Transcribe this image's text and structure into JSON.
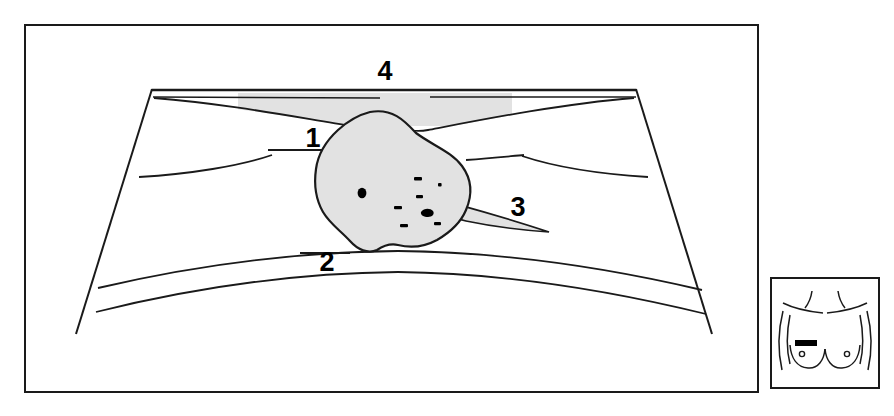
{
  "figure": {
    "kind": "anatomical-line-diagram",
    "title_visible": false,
    "background_color": "#ffffff",
    "line_color": "#1a1a1a",
    "mass_fill_color": "#e2e2e2",
    "band_fill_color": "#e2e2e2",
    "marks_color": "#000000"
  },
  "main_panel": {
    "name": "mammogram-cross-section-panel",
    "frame": {
      "x": 25,
      "y": 25,
      "width": 733,
      "height": 367,
      "stroke_width": 2
    }
  },
  "labels": [
    {
      "id": "1",
      "text": "1",
      "x": 322,
      "y": 137,
      "points_to": "skin-retraction-line"
    },
    {
      "id": "2",
      "text": "2",
      "x": 333,
      "y": 261,
      "points_to": "lower-parenchymal-border"
    },
    {
      "id": "3",
      "text": "3",
      "x": 521,
      "y": 214,
      "points_to": "spiculated-extension"
    },
    {
      "id": "4",
      "text": "4",
      "x": 387,
      "y": 80,
      "points_to": "shaded-skin-band"
    }
  ],
  "structures": {
    "shaded_band": {
      "name": "shaded-skin-band",
      "description": "horizontal shaded band along the top edge",
      "x_start": 238,
      "x_end": 512,
      "fill": "#e2e2e2"
    },
    "mass": {
      "name": "irregular-mass",
      "description": "central irregular shaded mass lesion",
      "fill": "#e2e2e2",
      "stroke": "#1a1a1a",
      "center_x": 398,
      "center_y": 186
    },
    "spiculation": {
      "name": "spiculated-extension",
      "description": "thin tapered wedge extending right from the mass toward label 3",
      "tip_x": 549,
      "tip_y": 232
    },
    "calcifications": {
      "name": "microcalcification-cluster",
      "count": 9,
      "marks": [
        {
          "type": "dot",
          "x": 362,
          "y": 193,
          "rx": 4.4,
          "ry": 5.0
        },
        {
          "type": "dash",
          "x": 418,
          "y": 179,
          "w": 7,
          "h": 3
        },
        {
          "type": "dot",
          "x": 440,
          "y": 185,
          "rx": 2.0,
          "ry": 2.0
        },
        {
          "type": "dash",
          "x": 419,
          "y": 196,
          "w": 6,
          "h": 3
        },
        {
          "type": "dash",
          "x": 398,
          "y": 208,
          "w": 7,
          "h": 3
        },
        {
          "type": "blob",
          "x": 427,
          "y": 213,
          "rx": 5.2,
          "ry": 3.6
        },
        {
          "type": "dash",
          "x": 404,
          "y": 226,
          "w": 7,
          "h": 3
        },
        {
          "type": "dash",
          "x": 438,
          "y": 224,
          "w": 6,
          "h": 3
        }
      ]
    },
    "lower_arcs": {
      "name": "lower-parenchymal-arcs",
      "count": 2
    },
    "lateral_lines": {
      "name": "lateral-tissue-lines",
      "count": 2
    }
  },
  "inset_panel": {
    "name": "body-location-inset",
    "description": "small torso diagram showing lesion location on the chest",
    "frame": {
      "x": 771,
      "y": 278,
      "width": 108,
      "height": 110,
      "stroke_width": 2
    },
    "marker": {
      "name": "lesion-location-marker",
      "shape": "filled-rectangle",
      "x": 795,
      "y": 340,
      "width": 22,
      "height": 6,
      "color": "#000000",
      "side": "left-breast-upper-inner"
    },
    "nipples": [
      {
        "x": 802,
        "y": 354,
        "r": 2.6
      },
      {
        "x": 847,
        "y": 354,
        "r": 2.6
      }
    ]
  }
}
